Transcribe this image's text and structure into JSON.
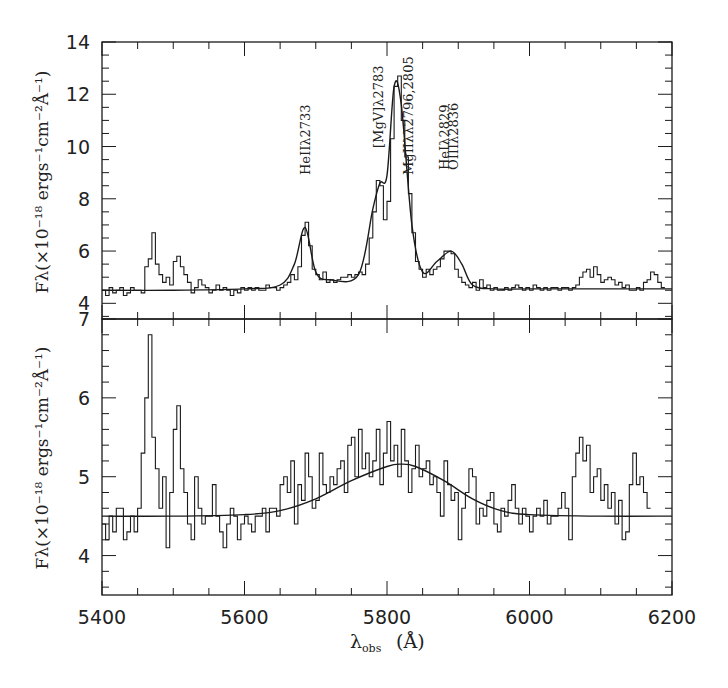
{
  "chart_data": [
    {
      "panel": "top",
      "type": "line",
      "title": "",
      "xlabel": "λobs (Å)",
      "ylabel": "Fλ(×10⁻¹⁸ ergs⁻¹cm⁻²Å⁻¹)",
      "xlim": [
        5400,
        6200
      ],
      "ylim": [
        3.4,
        14
      ],
      "xticks": [
        5400,
        5600,
        5800,
        6000,
        6200
      ],
      "yticks": [
        4,
        6,
        8,
        10,
        12,
        14
      ],
      "grid": false,
      "legend": null,
      "annotations": [
        {
          "text": "HeIIλ2733",
          "x": 5685
        },
        {
          "text": "[MgV]λ2783",
          "x": 5787
        },
        {
          "text": "MgIIλλ2796,2805",
          "x": 5830
        },
        {
          "text": "HeIλ2829",
          "x": 5880
        },
        {
          "text": "OIIIλ2836",
          "x": 5892
        }
      ],
      "series": [
        {
          "name": "observed spectrum",
          "style": "step",
          "x": [
            5400,
            5405,
            5410,
            5415,
            5420,
            5425,
            5430,
            5435,
            5440,
            5445,
            5450,
            5455,
            5460,
            5465,
            5470,
            5475,
            5480,
            5485,
            5490,
            5495,
            5500,
            5505,
            5510,
            5515,
            5520,
            5525,
            5530,
            5535,
            5540,
            5545,
            5550,
            5555,
            5560,
            5565,
            5570,
            5575,
            5580,
            5585,
            5590,
            5595,
            5600,
            5605,
            5610,
            5615,
            5620,
            5625,
            5630,
            5635,
            5640,
            5645,
            5650,
            5655,
            5660,
            5665,
            5670,
            5675,
            5680,
            5685,
            5690,
            5695,
            5700,
            5705,
            5710,
            5715,
            5720,
            5725,
            5730,
            5735,
            5740,
            5745,
            5750,
            5755,
            5760,
            5765,
            5770,
            5775,
            5780,
            5785,
            5790,
            5795,
            5800,
            5805,
            5810,
            5815,
            5820,
            5825,
            5830,
            5835,
            5840,
            5845,
            5850,
            5855,
            5860,
            5865,
            5870,
            5875,
            5880,
            5885,
            5890,
            5895,
            5900,
            5905,
            5910,
            5915,
            5920,
            5925,
            5930,
            5935,
            5940,
            5945,
            5950,
            5955,
            5960,
            5965,
            5970,
            5975,
            5980,
            5985,
            5990,
            5995,
            6000,
            6005,
            6010,
            6015,
            6020,
            6025,
            6030,
            6035,
            6040,
            6045,
            6050,
            6055,
            6060,
            6065,
            6070,
            6075,
            6080,
            6085,
            6090,
            6095,
            6100,
            6105,
            6110,
            6115,
            6120,
            6125,
            6130,
            6135,
            6140,
            6145,
            6150,
            6155,
            6160,
            6165,
            6170,
            6175,
            6180,
            6185,
            6190,
            6195
          ],
          "y": [
            4.5,
            4.3,
            4.6,
            4.4,
            4.5,
            4.6,
            4.3,
            4.4,
            4.6,
            4.5,
            4.5,
            4.4,
            5.4,
            5.7,
            6.7,
            5.5,
            5.1,
            4.8,
            5.0,
            4.7,
            5.6,
            5.8,
            5.4,
            5.1,
            4.8,
            4.4,
            4.6,
            4.9,
            4.7,
            4.6,
            4.4,
            4.5,
            4.7,
            4.5,
            4.6,
            4.5,
            4.3,
            4.5,
            4.4,
            4.6,
            4.5,
            4.6,
            4.5,
            4.6,
            4.5,
            4.5,
            4.7,
            4.6,
            4.6,
            4.5,
            4.6,
            4.7,
            4.8,
            5.1,
            4.9,
            5.4,
            6.6,
            7.1,
            6.2,
            5.3,
            5.1,
            4.9,
            5.2,
            4.8,
            4.9,
            4.8,
            4.9,
            5.0,
            5.0,
            5.1,
            5.0,
            5.1,
            5.2,
            5.1,
            5.5,
            6.5,
            7.5,
            8.7,
            8.5,
            7.2,
            7.9,
            10.3,
            12.3,
            12.7,
            11.0,
            9.6,
            8.2,
            6.7,
            5.6,
            5.3,
            5.0,
            5.3,
            5.1,
            5.3,
            5.4,
            5.7,
            6.0,
            6.0,
            5.9,
            5.3,
            5.0,
            4.8,
            4.7,
            4.6,
            4.8,
            4.5,
            4.9,
            4.6,
            4.7,
            4.5,
            4.6,
            4.5,
            4.5,
            4.6,
            4.5,
            4.6,
            4.7,
            4.6,
            4.5,
            4.6,
            4.5,
            4.7,
            4.6,
            4.5,
            4.6,
            4.5,
            4.6,
            4.6,
            4.5,
            4.6,
            4.6,
            4.5,
            4.6,
            4.7,
            5.0,
            5.2,
            5.3,
            5.0,
            5.4,
            5.1,
            4.8,
            4.9,
            5.0,
            4.9,
            4.7,
            4.8,
            4.6,
            4.7,
            4.5,
            4.5,
            4.6,
            4.5,
            4.8,
            4.9,
            5.2,
            5.1,
            4.8,
            4.6
          ]
        },
        {
          "name": "continuum + line fit",
          "style": "smooth",
          "x": [
            5400,
            5500,
            5600,
            5650,
            5670,
            5685,
            5700,
            5720,
            5760,
            5780,
            5790,
            5800,
            5810,
            5820,
            5835,
            5850,
            5870,
            5890,
            5905,
            5920,
            5950,
            6000,
            6100,
            6200
          ],
          "y": [
            4.5,
            4.5,
            4.55,
            4.7,
            5.5,
            6.9,
            5.2,
            4.9,
            5.1,
            7.6,
            8.6,
            8.9,
            12.3,
            11.6,
            7.0,
            5.2,
            5.6,
            6.0,
            5.5,
            4.7,
            4.55,
            4.55,
            4.55,
            4.55
          ]
        }
      ]
    },
    {
      "panel": "bottom",
      "type": "line",
      "title": "",
      "xlabel": "λobs (Å)",
      "ylabel": "Fλ(×10⁻¹⁸ ergs⁻¹cm⁻²Å⁻¹)",
      "xlim": [
        5400,
        6200
      ],
      "ylim": [
        3.5,
        7
      ],
      "xticks": [
        5400,
        5600,
        5800,
        6000,
        6200
      ],
      "yticks": [
        4,
        5,
        6,
        7
      ],
      "grid": false,
      "legend": null,
      "series": [
        {
          "name": "residual spectrum",
          "style": "step",
          "x": [
            5400,
            5405,
            5410,
            5415,
            5420,
            5425,
            5430,
            5435,
            5440,
            5445,
            5450,
            5455,
            5460,
            5465,
            5470,
            5475,
            5480,
            5485,
            5490,
            5495,
            5500,
            5505,
            5510,
            5515,
            5520,
            5525,
            5530,
            5535,
            5540,
            5545,
            5550,
            5555,
            5560,
            5565,
            5570,
            5575,
            5580,
            5585,
            5590,
            5595,
            5600,
            5605,
            5610,
            5615,
            5620,
            5625,
            5630,
            5635,
            5640,
            5645,
            5650,
            5655,
            5660,
            5665,
            5670,
            5675,
            5680,
            5685,
            5690,
            5695,
            5700,
            5705,
            5710,
            5715,
            5720,
            5725,
            5730,
            5735,
            5740,
            5745,
            5750,
            5755,
            5760,
            5765,
            5770,
            5775,
            5780,
            5785,
            5790,
            5795,
            5800,
            5805,
            5810,
            5815,
            5820,
            5825,
            5830,
            5835,
            5840,
            5845,
            5850,
            5855,
            5860,
            5865,
            5870,
            5875,
            5880,
            5885,
            5890,
            5895,
            5900,
            5905,
            5910,
            5915,
            5920,
            5925,
            5930,
            5935,
            5940,
            5945,
            5950,
            5955,
            5960,
            5965,
            5970,
            5975,
            5980,
            5985,
            5990,
            5995,
            6000,
            6005,
            6010,
            6015,
            6020,
            6025,
            6030,
            6035,
            6040,
            6045,
            6050,
            6055,
            6060,
            6065,
            6070,
            6075,
            6080,
            6085,
            6090,
            6095,
            6100,
            6105,
            6110,
            6115,
            6120,
            6125,
            6130,
            6135,
            6140,
            6145,
            6150,
            6155,
            6160,
            6165,
            6170,
            6175,
            6180,
            6185,
            6190,
            6195
          ],
          "y": [
            4.4,
            4.2,
            4.5,
            4.3,
            4.6,
            4.6,
            4.2,
            4.3,
            4.5,
            4.3,
            4.6,
            5.3,
            6.0,
            6.8,
            5.5,
            5.1,
            4.6,
            5.0,
            4.1,
            4.8,
            5.6,
            5.9,
            5.1,
            4.8,
            4.4,
            4.2,
            5.0,
            4.6,
            4.4,
            4.5,
            4.5,
            4.9,
            4.5,
            4.3,
            4.1,
            4.4,
            4.6,
            4.5,
            4.2,
            4.4,
            4.5,
            4.4,
            4.3,
            4.5,
            4.5,
            4.6,
            4.3,
            4.6,
            4.6,
            4.5,
            4.9,
            5.0,
            4.8,
            5.2,
            4.4,
            4.9,
            4.7,
            5.3,
            5.0,
            4.6,
            4.7,
            5.3,
            4.9,
            4.8,
            5.0,
            4.9,
            5.1,
            5.2,
            4.8,
            5.4,
            5.5,
            5.0,
            5.6,
            5.1,
            5.3,
            5.0,
            5.2,
            5.6,
            4.9,
            5.3,
            5.7,
            5.2,
            5.4,
            5.0,
            5.6,
            5.2,
            4.8,
            5.1,
            5.4,
            5.0,
            5.1,
            5.2,
            4.9,
            5.0,
            4.8,
            4.5,
            5.2,
            4.9,
            4.7,
            4.8,
            4.2,
            4.6,
            4.8,
            5.1,
            5.0,
            4.4,
            4.6,
            4.5,
            4.7,
            4.8,
            4.4,
            4.3,
            4.6,
            4.5,
            4.7,
            4.9,
            4.6,
            4.4,
            4.6,
            4.5,
            4.3,
            4.5,
            4.6,
            4.5,
            4.7,
            4.4,
            4.5,
            4.5,
            4.6,
            4.8,
            4.6,
            4.2,
            5.0,
            5.3,
            5.5,
            5.2,
            5.4,
            4.8,
            5.0,
            5.1,
            4.7,
            4.9,
            4.6,
            4.8,
            4.4,
            4.7,
            4.2,
            4.3,
            4.9,
            5.3,
            4.9,
            5.0,
            4.8,
            4.6
          ]
        },
        {
          "name": "broad Gaussian fit",
          "style": "smooth",
          "x": [
            5400,
            5500,
            5600,
            5650,
            5700,
            5750,
            5800,
            5820,
            5840,
            5880,
            5920,
            5960,
            6000,
            6100,
            6200
          ],
          "y": [
            4.5,
            4.5,
            4.52,
            4.57,
            4.72,
            4.95,
            5.13,
            5.16,
            5.13,
            4.95,
            4.72,
            4.57,
            4.52,
            4.5,
            4.5
          ]
        }
      ]
    }
  ],
  "axes": {
    "y_title_top": "Fλ(×10⁻¹⁸ ergs⁻¹cm⁻²Å⁻¹)",
    "y_title_bottom": "Fλ(×10⁻¹⁸ ergs⁻¹cm⁻²Å⁻¹)",
    "x_title_main": "λ",
    "x_title_sub": "obs",
    "x_title_unit": "(Å)"
  },
  "colors": {
    "ink": "#1a1a1a",
    "background": "#ffffff"
  }
}
